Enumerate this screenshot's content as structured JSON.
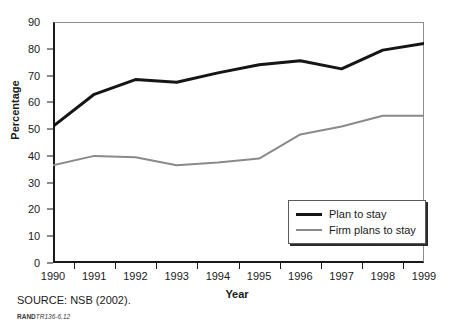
{
  "chart_data": {
    "type": "line",
    "title": "",
    "xlabel": "Year",
    "ylabel": "Percentage",
    "x": [
      1990,
      1991,
      1992,
      1993,
      1994,
      1995,
      1996,
      1997,
      1998,
      1999
    ],
    "categories": [
      "1990",
      "1991",
      "1992",
      "1993",
      "1994",
      "1995",
      "1996",
      "1997",
      "1998",
      "1999"
    ],
    "series": [
      {
        "name": "Plan to stay",
        "color": "#151515",
        "line_width": 3,
        "values": [
          51,
          63,
          68.5,
          67.5,
          71,
          74,
          75.5,
          72.5,
          79.5,
          82
        ]
      },
      {
        "name": "Firm plans to stay",
        "color": "#8a8a8a",
        "line_width": 2,
        "values": [
          36.5,
          40,
          39.5,
          36.5,
          37.5,
          39,
          48,
          51,
          55,
          55
        ]
      }
    ],
    "ylim": [
      0,
      90
    ],
    "y_ticks": [
      0,
      10,
      20,
      30,
      40,
      50,
      60,
      70,
      80,
      90
    ],
    "y_tick_labels": [
      "0",
      "10",
      "20",
      "30",
      "40",
      "50",
      "60",
      "70",
      "80",
      "90"
    ],
    "xlim": [
      1990,
      1999
    ],
    "grid": false,
    "legend_position": "bottom-right"
  },
  "axes": {
    "y_title": "Percentage",
    "x_title": "Year"
  },
  "legend": {
    "items": [
      {
        "label": "Plan to stay"
      },
      {
        "label": "Firm plans to stay"
      }
    ]
  },
  "captions": {
    "source": "SOURCE: NSB (2002).",
    "rand_mark": "RAND",
    "rand_number": "TR136-6.12"
  }
}
